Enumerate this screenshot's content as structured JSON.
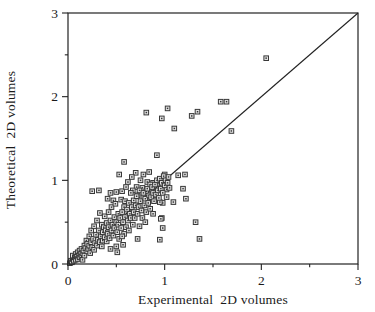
{
  "figure": {
    "background": "#ffffff",
    "axis_color": "#222222",
    "text_color": "#1a1a1a"
  },
  "chart_data": {
    "type": "scatter",
    "title": "",
    "xlabel": "Experimental  2D volumes",
    "ylabel": "Theoretical  2D volumes",
    "xlim": [
      0,
      3
    ],
    "ylim": [
      0,
      3
    ],
    "xticks": [
      0,
      1,
      2,
      3
    ],
    "xtick_labels": [
      "0",
      "1",
      "2",
      "3"
    ],
    "yticks": [
      0,
      1,
      2,
      3
    ],
    "ytick_labels": [
      "0",
      "1",
      "2",
      "3"
    ],
    "minor_tick_step": 0.5,
    "grid": false,
    "legend": "none",
    "identity_line": {
      "x1": 0,
      "y1": 0,
      "x2": 3,
      "y2": 3
    },
    "marker": {
      "shape": "square-with-center-dot",
      "size_px": 5,
      "fill": "#e2e2e2",
      "stroke": "#383838"
    },
    "points": [
      [
        2.05,
        2.46
      ],
      [
        1.58,
        1.94
      ],
      [
        1.64,
        1.94
      ],
      [
        1.34,
        1.82
      ],
      [
        1.28,
        1.77
      ],
      [
        1.69,
        1.59
      ],
      [
        1.03,
        1.86
      ],
      [
        0.81,
        1.81
      ],
      [
        0.97,
        1.74
      ],
      [
        1.1,
        1.62
      ],
      [
        1.14,
        1.06
      ],
      [
        1.21,
        1.07
      ],
      [
        1.19,
        0.9
      ],
      [
        1.22,
        0.78
      ],
      [
        1.09,
        0.74
      ],
      [
        0.98,
        0.73
      ],
      [
        0.97,
        0.55
      ],
      [
        1.32,
        0.5
      ],
      [
        1.36,
        0.3
      ],
      [
        0.74,
        0.45
      ],
      [
        0.88,
        0.6
      ],
      [
        0.96,
        0.54
      ],
      [
        0.98,
        0.43
      ],
      [
        0.72,
        0.3
      ],
      [
        0.95,
        0.29
      ],
      [
        0.5,
        0.21
      ],
      [
        0.44,
        0.18
      ],
      [
        0.51,
        0.14
      ],
      [
        0.57,
        0.23
      ],
      [
        0.58,
        1.22
      ],
      [
        0.53,
        1.07
      ],
      [
        0.62,
        0.98
      ],
      [
        0.92,
        1.3
      ],
      [
        0.25,
        0.87
      ],
      [
        0.32,
        0.88
      ],
      [
        0.44,
        0.85
      ],
      [
        0.5,
        0.86
      ],
      [
        0.56,
        0.87
      ],
      [
        0.41,
        0.78
      ],
      [
        0.47,
        0.76
      ],
      [
        0.7,
        1.09
      ],
      [
        0.78,
        1.07
      ],
      [
        0.84,
        1.1
      ],
      [
        0.66,
        1.04
      ],
      [
        0.75,
        1.0
      ],
      [
        0.82,
        0.98
      ],
      [
        1.0,
        1.07
      ],
      [
        0.88,
        0.97
      ],
      [
        0.93,
        0.96
      ],
      [
        0.71,
        0.92
      ],
      [
        0.77,
        0.91
      ],
      [
        0.67,
        0.88
      ],
      [
        0.81,
        0.87
      ],
      [
        0.86,
        0.89
      ],
      [
        1.02,
        0.89
      ],
      [
        0.72,
        0.82
      ],
      [
        0.78,
        0.8
      ],
      [
        0.83,
        0.79
      ],
      [
        0.9,
        0.77
      ],
      [
        0.95,
        0.74
      ],
      [
        0.02,
        0.01
      ],
      [
        0.03,
        0.04
      ],
      [
        0.04,
        0.02
      ],
      [
        0.05,
        0.06
      ],
      [
        0.05,
        0.1
      ],
      [
        0.06,
        0.04
      ],
      [
        0.07,
        0.08
      ],
      [
        0.08,
        0.05
      ],
      [
        0.08,
        0.12
      ],
      [
        0.09,
        0.09
      ],
      [
        0.1,
        0.06
      ],
      [
        0.1,
        0.14
      ],
      [
        0.11,
        0.1
      ],
      [
        0.12,
        0.08
      ],
      [
        0.12,
        0.16
      ],
      [
        0.13,
        0.12
      ],
      [
        0.14,
        0.09
      ],
      [
        0.14,
        0.18
      ],
      [
        0.15,
        0.13
      ],
      [
        0.15,
        0.05
      ],
      [
        0.16,
        0.16
      ],
      [
        0.17,
        0.22
      ],
      [
        0.17,
        0.1
      ],
      [
        0.18,
        0.19
      ],
      [
        0.19,
        0.28
      ],
      [
        0.2,
        0.15
      ],
      [
        0.2,
        0.24
      ],
      [
        0.21,
        0.18
      ],
      [
        0.22,
        0.33
      ],
      [
        0.22,
        0.22
      ],
      [
        0.23,
        0.13
      ],
      [
        0.24,
        0.26
      ],
      [
        0.24,
        0.4
      ],
      [
        0.25,
        0.2
      ],
      [
        0.26,
        0.3
      ],
      [
        0.27,
        0.17
      ],
      [
        0.27,
        0.45
      ],
      [
        0.28,
        0.25
      ],
      [
        0.29,
        0.35
      ],
      [
        0.3,
        0.22
      ],
      [
        0.3,
        0.52
      ],
      [
        0.31,
        0.29
      ],
      [
        0.32,
        0.4
      ],
      [
        0.33,
        0.26
      ],
      [
        0.33,
        0.61
      ],
      [
        0.34,
        0.33
      ],
      [
        0.35,
        0.21
      ],
      [
        0.35,
        0.47
      ],
      [
        0.36,
        0.38
      ],
      [
        0.36,
        0.28
      ],
      [
        0.37,
        0.44
      ],
      [
        0.38,
        0.32
      ],
      [
        0.38,
        0.57
      ],
      [
        0.39,
        0.4
      ],
      [
        0.4,
        0.27
      ],
      [
        0.4,
        0.49
      ],
      [
        0.41,
        0.36
      ],
      [
        0.42,
        0.62
      ],
      [
        0.42,
        0.44
      ],
      [
        0.43,
        0.31
      ],
      [
        0.44,
        0.52
      ],
      [
        0.45,
        0.4
      ],
      [
        0.45,
        0.68
      ],
      [
        0.46,
        0.47
      ],
      [
        0.47,
        0.34
      ],
      [
        0.48,
        0.56
      ],
      [
        0.48,
        0.43
      ],
      [
        0.49,
        0.72
      ],
      [
        0.5,
        0.5
      ],
      [
        0.51,
        0.38
      ],
      [
        0.52,
        0.6
      ],
      [
        0.52,
        0.47
      ],
      [
        0.53,
        0.3
      ],
      [
        0.54,
        0.55
      ],
      [
        0.55,
        0.43
      ],
      [
        0.55,
        0.77
      ],
      [
        0.56,
        0.62
      ],
      [
        0.57,
        0.5
      ],
      [
        0.58,
        0.36
      ],
      [
        0.58,
        0.68
      ],
      [
        0.59,
        0.56
      ],
      [
        0.6,
        0.44
      ],
      [
        0.6,
        0.92
      ],
      [
        0.56,
        0.33
      ],
      [
        0.59,
        0.75
      ],
      [
        0.61,
        0.65
      ],
      [
        0.62,
        0.52
      ],
      [
        0.63,
        0.73
      ],
      [
        0.63,
        0.4
      ],
      [
        0.64,
        0.6
      ],
      [
        0.65,
        0.85
      ],
      [
        0.65,
        0.55
      ],
      [
        0.66,
        0.68
      ],
      [
        0.67,
        0.47
      ],
      [
        0.68,
        0.76
      ],
      [
        0.68,
        0.62
      ],
      [
        0.69,
        0.55
      ],
      [
        0.7,
        0.7
      ],
      [
        0.71,
        0.81
      ],
      [
        0.72,
        0.6
      ],
      [
        0.73,
        0.68
      ],
      [
        0.74,
        0.88
      ],
      [
        0.75,
        0.75
      ],
      [
        0.76,
        0.64
      ],
      [
        0.77,
        0.55
      ],
      [
        0.78,
        0.85
      ],
      [
        0.79,
        0.7
      ],
      [
        0.8,
        0.78
      ],
      [
        0.81,
        0.62
      ],
      [
        0.82,
        0.9
      ],
      [
        0.83,
        0.73
      ],
      [
        0.84,
        0.82
      ],
      [
        0.85,
        0.66
      ],
      [
        0.85,
        0.95
      ],
      [
        0.8,
        0.5
      ],
      [
        0.86,
        0.8
      ],
      [
        0.87,
        0.92
      ],
      [
        0.88,
        0.85
      ],
      [
        0.89,
        0.75
      ],
      [
        0.9,
        0.95
      ],
      [
        0.91,
        0.83
      ],
      [
        0.92,
        1.0
      ],
      [
        0.93,
        0.88
      ],
      [
        0.94,
        0.79
      ],
      [
        0.95,
        1.02
      ],
      [
        0.96,
        0.9
      ],
      [
        0.97,
        0.97
      ],
      [
        0.98,
        0.85
      ],
      [
        0.99,
        1.05
      ],
      [
        1.0,
        0.94
      ],
      [
        1.01,
        1.0
      ],
      [
        1.02,
        0.8
      ],
      [
        1.03,
        0.97
      ],
      [
        1.04,
        1.04
      ],
      [
        1.05,
        0.91
      ]
    ]
  }
}
